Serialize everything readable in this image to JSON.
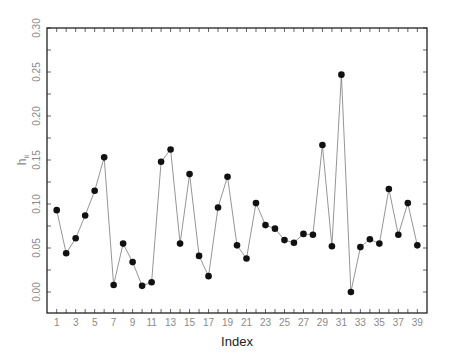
{
  "chart_data": {
    "type": "line",
    "title": "",
    "xlabel": "Index",
    "ylabel": "h_ii",
    "ylabel_main": "h",
    "ylabel_sub": "ii",
    "markers": true,
    "grid": false,
    "legend": null,
    "xlim": [
      1,
      39
    ],
    "ylim": [
      0.0,
      0.3
    ],
    "x_tick_labels": [
      "1",
      "3",
      "5",
      "7",
      "9",
      "11",
      "13",
      "15",
      "17",
      "19",
      "21",
      "23",
      "25",
      "27",
      "29",
      "31",
      "33",
      "35",
      "37",
      "39"
    ],
    "y_tick_labels": [
      "0.00",
      "0.05",
      "0.10",
      "0.15",
      "0.20",
      "0.25",
      "0.30"
    ],
    "x": [
      1,
      2,
      3,
      4,
      5,
      6,
      7,
      8,
      9,
      10,
      11,
      12,
      13,
      14,
      15,
      16,
      17,
      18,
      19,
      20,
      21,
      22,
      23,
      24,
      25,
      26,
      27,
      28,
      29,
      30,
      31,
      32,
      33,
      34,
      35,
      36,
      37,
      38,
      39
    ],
    "series": [
      {
        "name": "h_ii",
        "values": [
          0.093,
          0.044,
          0.061,
          0.087,
          0.115,
          0.153,
          0.008,
          0.055,
          0.034,
          0.007,
          0.011,
          0.148,
          0.162,
          0.055,
          0.134,
          0.041,
          0.018,
          0.096,
          0.131,
          0.053,
          0.038,
          0.101,
          0.076,
          0.072,
          0.059,
          0.056,
          0.066,
          0.065,
          0.167,
          0.052,
          0.247,
          0.0,
          0.051,
          0.06,
          0.055,
          0.117,
          0.065,
          0.101,
          0.053
        ]
      }
    ],
    "colors": {
      "axis": "#222222",
      "line": "#7a7a7a",
      "marker": "#111111",
      "tick_label": "#8a8a8a"
    }
  }
}
